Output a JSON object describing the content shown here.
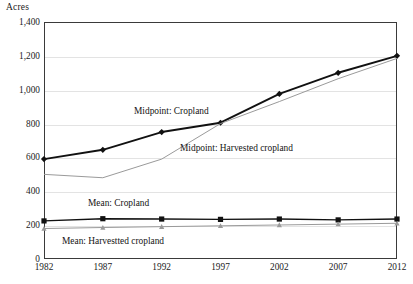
{
  "chart_data": {
    "type": "line",
    "title": "",
    "ylabel": "Acres",
    "xlabel": "",
    "x": [
      1982,
      1987,
      1992,
      1997,
      2002,
      2007,
      2012
    ],
    "xtick_labels": [
      "1982",
      "1987",
      "1992",
      "1997",
      "2002",
      "2007",
      "2012"
    ],
    "ytick_labels": [
      "0",
      "200",
      "400",
      "600",
      "800",
      "1,000",
      "1,200",
      "1,400"
    ],
    "ytick_values": [
      0,
      200,
      400,
      600,
      800,
      1000,
      1200,
      1400
    ],
    "ylim": [
      0,
      1400
    ],
    "xlim": [
      1982,
      2012
    ],
    "grid": true,
    "grid_axis": "y",
    "legend_position": "inline-annotations",
    "series": [
      {
        "name": "Midpoint: Cropland",
        "values": [
          590,
          645,
          750,
          805,
          975,
          1100,
          1200
        ],
        "color": "#111111",
        "marker": "diamond",
        "line_width": 1.9
      },
      {
        "name": "Midpoint: Harvested cropland",
        "values": [
          500,
          480,
          590,
          800,
          930,
          1065,
          1185
        ],
        "color": "#9a9a9a",
        "marker": "none",
        "line_width": 1.0
      },
      {
        "name": "Mean: Cropland",
        "values": [
          225,
          238,
          236,
          234,
          236,
          231,
          236
        ],
        "color": "#111111",
        "marker": "square",
        "line_width": 1.4
      },
      {
        "name": "Mean: Harvested cropland",
        "values": [
          180,
          186,
          191,
          196,
          201,
          206,
          211
        ],
        "color": "#9a9a9a",
        "marker": "triangle",
        "line_width": 1.0
      }
    ],
    "annotations": [
      {
        "text": "Midpoint: Cropland",
        "x_px": 134,
        "y_px": 106
      },
      {
        "text": "Midpoint: Harvested cropland",
        "x_px": 180,
        "y_px": 143
      },
      {
        "text": "Mean: Cropland",
        "x_px": 88,
        "y_px": 198
      },
      {
        "text": "Mean: Harvestted cropland",
        "x_px": 62,
        "y_px": 236
      }
    ]
  },
  "colors": {
    "axis": "#3a3a3a",
    "grid": "#e3e3e3",
    "dark_series": "#111111",
    "light_series": "#9a9a9a",
    "text": "#1a1a1a",
    "background": "#ffffff"
  }
}
